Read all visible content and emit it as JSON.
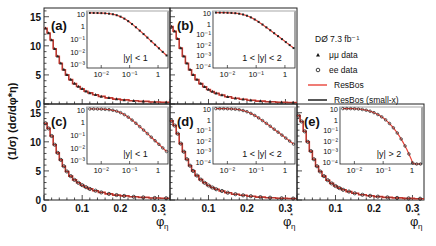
{
  "figure": {
    "ylabel": "(1/σ) (dσ/dφ*η)",
    "xlabel": "φ*η",
    "legend": {
      "title": "DØ 7.3 fb⁻¹",
      "entries": [
        {
          "label": "μμ data",
          "marker": "triangle-filled",
          "color": "#111111"
        },
        {
          "label": "ee data",
          "marker": "circle-open",
          "color": "#111111"
        },
        {
          "label": "ResBos",
          "marker": "line",
          "color": "#e8443a"
        },
        {
          "label": "ResBos (small-x)",
          "marker": "line",
          "color": "#111111"
        }
      ]
    },
    "colors": {
      "resbos": "#e8443a",
      "smallx": "#111111",
      "data": "#222222"
    }
  },
  "chart_data": [
    {
      "panel": "(a)",
      "type": "line",
      "channel": "μμ",
      "rapidity": "|y| < 1",
      "xlim": [
        0,
        0.33
      ],
      "ylim": [
        0,
        16.5
      ],
      "xticks": [
        0,
        0.1,
        0.2,
        0.3
      ],
      "yticks": [
        0,
        5,
        10,
        15
      ],
      "x": [
        0.004,
        0.012,
        0.02,
        0.028,
        0.036,
        0.044,
        0.052,
        0.06,
        0.07,
        0.08,
        0.09,
        0.1,
        0.11,
        0.12,
        0.135,
        0.15,
        0.17,
        0.19,
        0.21,
        0.235,
        0.26,
        0.29,
        0.32
      ],
      "values": [
        13.0,
        12.2,
        11.0,
        9.5,
        8.2,
        7.0,
        5.9,
        5.0,
        4.2,
        3.5,
        3.0,
        2.6,
        2.2,
        1.9,
        1.6,
        1.3,
        1.05,
        0.85,
        0.7,
        0.55,
        0.45,
        0.35,
        0.3
      ],
      "inset": {
        "scale": "log-log",
        "xticks": [
          "10⁻²",
          "10⁻¹",
          "1"
        ],
        "yticks": [
          "10",
          "1",
          "10⁻¹",
          "10⁻²",
          "10⁻³"
        ],
        "label": "|y| < 1"
      }
    },
    {
      "panel": "(b)",
      "type": "line",
      "channel": "μμ",
      "rapidity": "1 < |y| < 2",
      "xlim": [
        0,
        0.33
      ],
      "ylim": [
        0,
        16.5
      ],
      "x": [
        0.004,
        0.012,
        0.02,
        0.028,
        0.036,
        0.044,
        0.052,
        0.06,
        0.07,
        0.08,
        0.09,
        0.1,
        0.11,
        0.12,
        0.135,
        0.15,
        0.17,
        0.19,
        0.21,
        0.235,
        0.26,
        0.29,
        0.32
      ],
      "values": [
        13.3,
        12.5,
        11.2,
        9.6,
        8.2,
        7.0,
        5.9,
        5.0,
        4.2,
        3.5,
        2.95,
        2.5,
        2.15,
        1.85,
        1.55,
        1.25,
        1.0,
        0.8,
        0.65,
        0.5,
        0.4,
        0.3,
        0.25
      ],
      "inset": {
        "scale": "log-log",
        "xticks": [
          "10⁻²",
          "10⁻¹",
          "1"
        ],
        "yticks": [
          "10",
          "1",
          "10⁻¹",
          "10⁻²",
          "10⁻³",
          "10⁻⁴"
        ],
        "label": "1 < |y| < 2"
      }
    },
    {
      "panel": "(c)",
      "type": "line",
      "channel": "ee",
      "rapidity": "|y| < 1",
      "xlim": [
        0,
        0.33
      ],
      "ylim": [
        0,
        16.5
      ],
      "xticks": [
        0,
        0.1,
        0.2,
        0.3
      ],
      "yticks": [
        0,
        5,
        10,
        15
      ],
      "x": [
        0.004,
        0.012,
        0.02,
        0.028,
        0.036,
        0.044,
        0.052,
        0.06,
        0.07,
        0.08,
        0.09,
        0.1,
        0.11,
        0.12,
        0.135,
        0.15,
        0.17,
        0.19,
        0.21,
        0.235,
        0.26,
        0.29,
        0.32
      ],
      "values": [
        13.2,
        12.3,
        11.0,
        9.5,
        8.1,
        6.9,
        5.8,
        4.9,
        4.1,
        3.45,
        2.95,
        2.55,
        2.2,
        1.9,
        1.6,
        1.3,
        1.05,
        0.85,
        0.7,
        0.55,
        0.45,
        0.35,
        0.3
      ],
      "inset": {
        "scale": "log-log",
        "xticks": [
          "10⁻²",
          "10⁻¹",
          "1"
        ],
        "yticks": [
          "10",
          "1",
          "10⁻¹",
          "10⁻²",
          "10⁻³"
        ],
        "label": "|y| < 1"
      }
    },
    {
      "panel": "(d)",
      "type": "line",
      "channel": "ee",
      "rapidity": "1 < |y| < 2",
      "xlim": [
        0,
        0.33
      ],
      "ylim": [
        0,
        16.5
      ],
      "xticks": [
        0.1,
        0.2,
        0.3
      ],
      "x": [
        0.004,
        0.012,
        0.02,
        0.028,
        0.036,
        0.044,
        0.052,
        0.06,
        0.07,
        0.08,
        0.09,
        0.1,
        0.11,
        0.12,
        0.135,
        0.15,
        0.17,
        0.19,
        0.21,
        0.235,
        0.26,
        0.29,
        0.32
      ],
      "values": [
        13.6,
        12.8,
        11.4,
        9.7,
        8.3,
        7.0,
        5.9,
        5.0,
        4.2,
        3.5,
        2.95,
        2.5,
        2.15,
        1.85,
        1.55,
        1.25,
        1.0,
        0.8,
        0.65,
        0.5,
        0.4,
        0.3,
        0.25
      ],
      "inset": {
        "scale": "log-log",
        "xticks": [
          "10⁻²",
          "10⁻¹",
          "1"
        ],
        "yticks": [
          "10",
          "1",
          "10⁻¹",
          "10⁻²",
          "10⁻³",
          "10⁻⁴"
        ],
        "label": "1 < |y| < 2"
      }
    },
    {
      "panel": "(e)",
      "type": "line",
      "channel": "ee",
      "rapidity": "|y| > 2",
      "xlim": [
        0,
        0.33
      ],
      "ylim": [
        0,
        16.5
      ],
      "xticks": [
        0.1,
        0.2,
        0.3
      ],
      "x": [
        0.004,
        0.012,
        0.02,
        0.028,
        0.036,
        0.044,
        0.052,
        0.06,
        0.07,
        0.08,
        0.09,
        0.1,
        0.11,
        0.12,
        0.135,
        0.15,
        0.17,
        0.19,
        0.21,
        0.235,
        0.26,
        0.29,
        0.32
      ],
      "values": [
        14.5,
        13.5,
        11.8,
        10.0,
        8.4,
        7.0,
        5.8,
        4.9,
        4.1,
        3.4,
        2.85,
        2.4,
        2.05,
        1.75,
        1.45,
        1.15,
        0.9,
        0.72,
        0.58,
        0.45,
        0.36,
        0.28,
        0.22
      ],
      "inset": {
        "scale": "log-log",
        "xticks": [
          "10⁻²",
          "10⁻¹",
          "1"
        ],
        "yticks": [
          "10",
          "1",
          "10⁻¹",
          "10⁻²",
          "10⁻³",
          "10⁻⁴"
        ],
        "label": "|y| > 2"
      }
    }
  ]
}
